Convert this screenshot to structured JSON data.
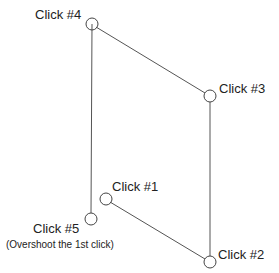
{
  "diagram": {
    "colors": {
      "line": "#555555",
      "circle": "#444444",
      "text": "#222222",
      "background": "#ffffff"
    },
    "clicks": [
      {
        "id": 1,
        "label": "Click #1",
        "x": 106,
        "y": 199
      },
      {
        "id": 2,
        "label": "Click #2",
        "x": 210,
        "y": 262
      },
      {
        "id": 3,
        "label": "Click #3",
        "x": 210,
        "y": 96
      },
      {
        "id": 4,
        "label": "Click #4",
        "x": 92,
        "y": 24
      },
      {
        "id": 5,
        "label": "Click #5",
        "x": 91,
        "y": 219,
        "note": "(Overshoot the 1st click)"
      }
    ]
  }
}
